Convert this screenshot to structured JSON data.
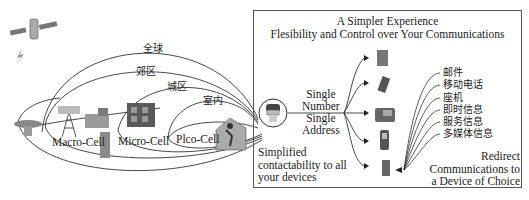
{
  "diagram": {
    "coverage_zones": [
      {
        "label": "全球",
        "meaning": "Global"
      },
      {
        "label": "郊区",
        "meaning": "Suburban"
      },
      {
        "label": "城区",
        "meaning": "Urban"
      },
      {
        "label": "室内",
        "meaning": "Indoor"
      }
    ],
    "cells": [
      {
        "label": "Macro-Cell"
      },
      {
        "label": "Micro-Cell"
      },
      {
        "label": "Plco-Cell"
      }
    ],
    "icons": [
      "satellite-icon",
      "lightning-icon",
      "satellite-dish-icon",
      "antenna-tower-icon",
      "city-buildings-icon",
      "office-building-icon",
      "house-icon",
      "user-avatar-icon"
    ],
    "panel": {
      "title_line1": "A Simpler Experience",
      "title_line2": "Flesibility and Control over Your Communications",
      "single_number_line1": "Single",
      "single_number_line2": "Number",
      "single_address_line1": "Single",
      "single_address_line2": "Address",
      "simplified_line1": "Simplified",
      "simplified_line2": "contactability to all",
      "simplified_line3": "your devices",
      "redirect_line1": "Redirect",
      "redirect_line2": "Communications to",
      "redirect_line3": "a Device of Choice",
      "devices": [
        "fax-machine-icon",
        "pda-icon",
        "desk-phone-icon",
        "mobile-phone-icon",
        "cordless-phone-icon"
      ],
      "services": [
        {
          "label": "邮件",
          "meaning": "Email"
        },
        {
          "label": "移动电话",
          "meaning": "Mobile phone"
        },
        {
          "label": "座机",
          "meaning": "Landline"
        },
        {
          "label": "即时信息",
          "meaning": "Instant message"
        },
        {
          "label": "服务信息",
          "meaning": "Service message"
        },
        {
          "label": "多媒体信息",
          "meaning": "Multimedia message"
        }
      ]
    }
  }
}
